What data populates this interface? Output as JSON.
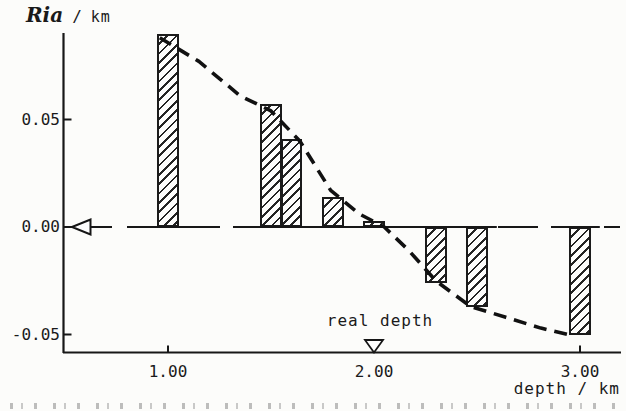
{
  "figure": {
    "ylabel_ria": "Ria",
    "ylabel_slash": "/",
    "ylabel_unit": "km",
    "xlabel": "depth / km",
    "real_depth_label": "real depth"
  },
  "chart_data": {
    "type": "bar",
    "title": "",
    "ylabel": "Ria / km",
    "xlabel": "depth / km",
    "x": [
      1.0,
      1.5,
      1.6,
      1.8,
      2.0,
      2.3,
      2.5,
      3.0
    ],
    "values": [
      0.09,
      0.057,
      0.041,
      0.014,
      0.003,
      -0.026,
      -0.037,
      -0.05
    ],
    "bar_width_km": 0.105,
    "xlim": [
      0.5,
      3.2
    ],
    "ylim": [
      -0.062,
      0.095
    ],
    "yticks": [
      0.05,
      0.0,
      -0.05
    ],
    "ytick_labels": [
      "0.05",
      "0.00",
      "-0.05"
    ],
    "xticks": [
      1.0,
      2.0,
      3.0
    ],
    "xtick_labels": [
      "1.00",
      "2.00",
      "3.00"
    ],
    "grid": false,
    "legend": "none",
    "zero_reference_line": 0.0,
    "zero_arrow_y": 0.0,
    "real_depth_x": 2.0,
    "curve_name": "dashed trend curve",
    "curve": [
      [
        0.96,
        0.088
      ],
      [
        1.15,
        0.077
      ],
      [
        1.35,
        0.061
      ],
      [
        1.5,
        0.054
      ],
      [
        1.64,
        0.04
      ],
      [
        1.79,
        0.017
      ],
      [
        1.93,
        0.006
      ],
      [
        2.05,
        0.0
      ],
      [
        2.17,
        -0.011
      ],
      [
        2.3,
        -0.025
      ],
      [
        2.47,
        -0.037
      ],
      [
        2.64,
        -0.042
      ],
      [
        2.81,
        -0.047
      ],
      [
        2.94,
        -0.05
      ]
    ]
  }
}
